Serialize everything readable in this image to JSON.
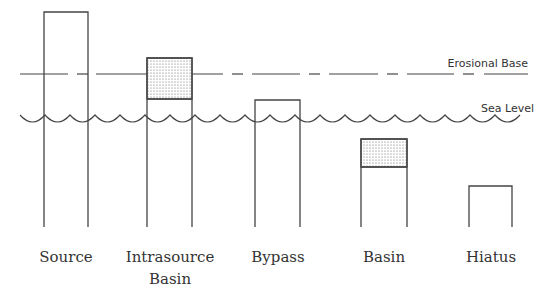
{
  "diagram": {
    "line_color": "#333333",
    "stipple_fill": "#d9d9d9",
    "reference_lines": {
      "erosional_base": {
        "label": "Erosional Base",
        "y": 74
      },
      "sea_level": {
        "label": "Sea Level",
        "y": 115
      }
    },
    "columns": [
      {
        "id": "source",
        "label": [
          "Source"
        ],
        "x": 44,
        "width": 44,
        "top": 12,
        "stipple_to": null
      },
      {
        "id": "intrasource-basin",
        "label": [
          "Intrasource",
          "Basin"
        ],
        "x": 147,
        "width": 45,
        "top": 58,
        "stipple_to": 99
      },
      {
        "id": "bypass",
        "label": [
          "Bypass"
        ],
        "x": 255,
        "width": 45,
        "top": 100,
        "stipple_to": null
      },
      {
        "id": "basin",
        "label": [
          "Basin"
        ],
        "x": 361,
        "width": 46,
        "top": 139,
        "stipple_to": 167
      },
      {
        "id": "hiatus",
        "label": [
          "Hiatus"
        ],
        "x": 469,
        "width": 43,
        "top": 186,
        "stipple_to": null
      }
    ],
    "column_bottom": 227
  },
  "labels": {
    "erosional_base": "Erosional Base",
    "sea_level": "Sea Level",
    "source": "Source",
    "intrasource_1": "Intrasource",
    "intrasource_2": "Basin",
    "bypass": "Bypass",
    "basin": "Basin",
    "hiatus": "Hiatus"
  }
}
